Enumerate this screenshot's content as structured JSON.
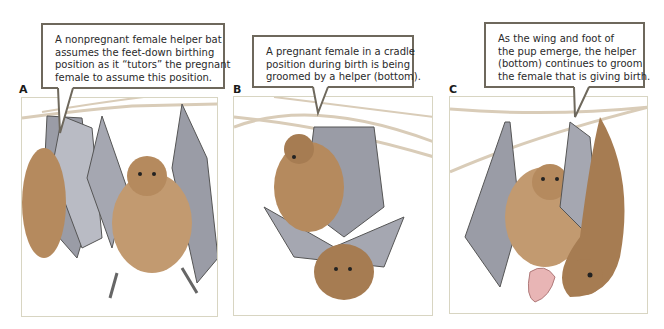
{
  "figure": {
    "panels": [
      {
        "id": "A",
        "label": "A",
        "caption_lines": [
          "A nonpregnant female helper bat",
          "assumes the feet-down birthing",
          "position as it “tutors” the pregnant",
          "female to assume this position."
        ],
        "illustration": "Two fruit bats hanging from a branch: a nonpregnant helper in feet-down birthing posture with wings spread, and the pregnant female at left"
      },
      {
        "id": "B",
        "label": "B",
        "caption_lines": [
          "A pregnant female in a cradle",
          "position during birth is being",
          "groomed by a helper (bottom)."
        ],
        "illustration": "Pregnant female bat in cradle position hanging from branches, with a helper bat below grooming her"
      },
      {
        "id": "C",
        "label": "C",
        "caption_lines": [
          "As the wing and foot of",
          "the pup emerge, the helper",
          "(bottom) continues to groom",
          "the female that is giving birth."
        ],
        "illustration": "Helper bat grooming the birthing female as the pink pup's wing and foot emerge"
      }
    ],
    "colors": {
      "panel_border": "#d8d5c2",
      "callout_border": "#6e685c",
      "fur": "#a67c52",
      "wing": "#8d8f99",
      "branch": "#d9ccb8",
      "pup": "#e8b5b5"
    }
  }
}
